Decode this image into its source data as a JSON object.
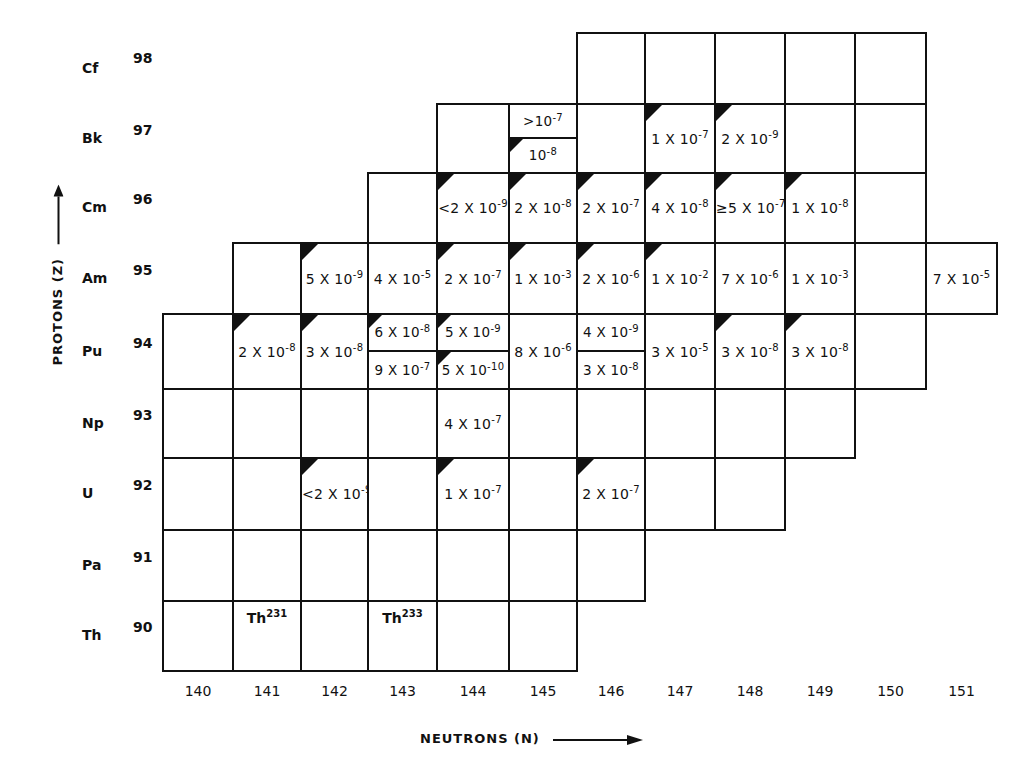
{
  "chart_data": {
    "type": "table",
    "title": "",
    "xlabel": "NEUTRONS (N)",
    "ylabel": "PROTONS (Z)",
    "neutron_ticks": [
      "140",
      "141",
      "142",
      "143",
      "144",
      "145",
      "146",
      "147",
      "148",
      "149",
      "150",
      "151"
    ],
    "rows": [
      {
        "symbol": "Cf",
        "z": "98",
        "n_range": [
          146,
          150
        ],
        "cells": {}
      },
      {
        "symbol": "Bk",
        "z": "97",
        "n_range": [
          144,
          150
        ],
        "cells": {
          "145": {
            "split": [
              {
                "text": ">10",
                "exp": "-7",
                "marker": false
              },
              {
                "text": "10",
                "exp": "-8",
                "marker": true
              }
            ]
          },
          "147": {
            "text": "1 X 10",
            "exp": "-7",
            "marker": true
          },
          "148": {
            "text": "2 X 10",
            "exp": "-9",
            "marker": true
          }
        }
      },
      {
        "symbol": "Cm",
        "z": "96",
        "n_range": [
          143,
          150
        ],
        "cells": {
          "144": {
            "text": "<2 X 10",
            "exp": "-9",
            "marker": true
          },
          "145": {
            "text": "2 X 10",
            "exp": "-8",
            "marker": true
          },
          "146": {
            "text": "2 X 10",
            "exp": "-7",
            "marker": true
          },
          "147": {
            "text": "4 X 10",
            "exp": "-8",
            "marker": true
          },
          "148": {
            "text": "≥5 X 10",
            "exp": "-7",
            "marker": true
          },
          "149": {
            "text": "1 X 10",
            "exp": "-8",
            "marker": true
          }
        }
      },
      {
        "symbol": "Am",
        "z": "95",
        "n_range": [
          141,
          151
        ],
        "cells": {
          "142": {
            "text": "5 X 10",
            "exp": "-9",
            "marker": true
          },
          "143": {
            "text": "4 X 10",
            "exp": "-5",
            "marker": false
          },
          "144": {
            "text": "2 X 10",
            "exp": "-7",
            "marker": true
          },
          "145": {
            "text": "1 X 10",
            "exp": "-3",
            "marker": true
          },
          "146": {
            "text": "2 X 10",
            "exp": "-6",
            "marker": true
          },
          "147": {
            "text": "1 X 10",
            "exp": "-2",
            "marker": true
          },
          "148": {
            "text": "7 X 10",
            "exp": "-6",
            "marker": false
          },
          "149": {
            "text": "1 X 10",
            "exp": "-3",
            "marker": false
          },
          "151": {
            "text": "7 X 10",
            "exp": "-5",
            "marker": false
          }
        }
      },
      {
        "symbol": "Pu",
        "z": "94",
        "n_range": [
          140,
          150
        ],
        "cells": {
          "141": {
            "text": "2 X 10",
            "exp": "-8",
            "marker": true
          },
          "142": {
            "text": "3 X 10",
            "exp": "-8",
            "marker": true
          },
          "143": {
            "split": [
              {
                "text": "6 X 10",
                "exp": "-8",
                "marker": true
              },
              {
                "text": "9 X 10",
                "exp": "-7",
                "marker": false
              }
            ]
          },
          "144": {
            "split": [
              {
                "text": "5 X 10",
                "exp": "-9",
                "marker": true
              },
              {
                "text": "5 X 10",
                "exp": "-10",
                "marker": true
              }
            ]
          },
          "145": {
            "text": "8 X 10",
            "exp": "-6",
            "marker": false
          },
          "146": {
            "split": [
              {
                "text": "4 X 10",
                "exp": "-9",
                "marker": false
              },
              {
                "text": "3 X 10",
                "exp": "-8",
                "marker": false
              }
            ]
          },
          "147": {
            "text": "3 X 10",
            "exp": "-5",
            "marker": false
          },
          "148": {
            "text": "3 X 10",
            "exp": "-8",
            "marker": true
          },
          "149": {
            "text": "3 X 10",
            "exp": "-8",
            "marker": true
          }
        }
      },
      {
        "symbol": "Np",
        "z": "93",
        "n_range": [
          140,
          149
        ],
        "cells": {
          "144": {
            "text": "4 X 10",
            "exp": "-7",
            "marker": false
          }
        }
      },
      {
        "symbol": "U",
        "z": "92",
        "n_range": [
          140,
          148
        ],
        "cells": {
          "142": {
            "text": "<2 X 10",
            "exp": "-9",
            "marker": true
          },
          "144": {
            "text": "1 X 10",
            "exp": "-7",
            "marker": true
          },
          "146": {
            "text": "2 X 10",
            "exp": "-7",
            "marker": true
          }
        }
      },
      {
        "symbol": "Pa",
        "z": "91",
        "n_range": [
          140,
          146
        ],
        "cells": {}
      },
      {
        "symbol": "Th",
        "z": "90",
        "n_range": [
          140,
          145
        ],
        "cells": {
          "141": {
            "label": "Th",
            "mass": "231"
          },
          "143": {
            "label": "Th",
            "mass": "233"
          }
        }
      }
    ]
  },
  "axes": {
    "y_title": "PROTONS (Z)",
    "x_title": "NEUTRONS (N)"
  },
  "colors": {
    "line": "#111111",
    "background": "#ffffff",
    "marker": "#111111"
  }
}
